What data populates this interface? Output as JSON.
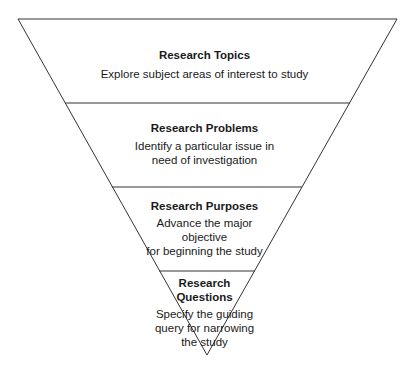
{
  "diagram": {
    "type": "inverted-funnel",
    "stages": [
      {
        "title": "Research Topics",
        "description": [
          "Explore subject areas of interest to study"
        ]
      },
      {
        "title": "Research Problems",
        "description": [
          "Identify a particular issue in",
          "need of investigation"
        ]
      },
      {
        "title": "Research Purposes",
        "description": [
          "Advance the major",
          "objective",
          "for beginning the study"
        ]
      },
      {
        "title": [
          "Research",
          "Questions"
        ],
        "description": [
          "Specify the guiding",
          "query for narrowing",
          "the study"
        ]
      }
    ],
    "colors": {
      "stroke": "#333333",
      "fill": "#ffffff"
    }
  }
}
